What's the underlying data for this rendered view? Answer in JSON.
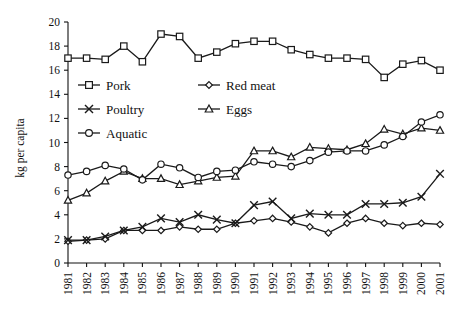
{
  "chart_data": {
    "type": "line",
    "title": "",
    "xlabel": "",
    "ylabel": "kg per capita",
    "xlim": [
      1981,
      2001
    ],
    "ylim": [
      0,
      20
    ],
    "ytick_step": 2,
    "grid": false,
    "legend_position": "inside-top-left",
    "x": [
      1981,
      1982,
      1983,
      1984,
      1985,
      1986,
      1987,
      1988,
      1989,
      1990,
      1991,
      1992,
      1993,
      1994,
      1995,
      1996,
      1997,
      1998,
      1999,
      2000,
      2001
    ],
    "categories": [
      "1981",
      "1982",
      "1983",
      "1984",
      "1985",
      "1986",
      "1987",
      "1988",
      "1989",
      "1990",
      "1991",
      "1992",
      "1993",
      "1994",
      "1995",
      "1996",
      "1997",
      "1998",
      "1999",
      "2000",
      "2001"
    ],
    "yticks": [
      "0",
      "2",
      "4",
      "6",
      "8",
      "10",
      "12",
      "14",
      "16",
      "18",
      "20"
    ],
    "series": [
      {
        "name": "Pork",
        "marker": "square",
        "values": [
          17.0,
          17.0,
          16.9,
          18.0,
          16.7,
          19.0,
          18.8,
          17.0,
          17.5,
          18.2,
          18.4,
          18.4,
          17.7,
          17.3,
          17.0,
          17.0,
          16.9,
          15.4,
          16.5,
          16.8,
          16.0
        ]
      },
      {
        "name": "Red meat",
        "marker": "diamond",
        "values": [
          1.8,
          1.9,
          2.0,
          2.7,
          2.7,
          2.7,
          3.0,
          2.8,
          2.8,
          3.3,
          3.5,
          3.7,
          3.4,
          3.0,
          2.5,
          3.3,
          3.7,
          3.3,
          3.1,
          3.3,
          3.2
        ]
      },
      {
        "name": "Poultry",
        "marker": "cross",
        "values": [
          1.9,
          1.9,
          2.2,
          2.7,
          3.0,
          3.7,
          3.4,
          4.0,
          3.6,
          3.3,
          4.8,
          5.1,
          3.7,
          4.1,
          4.0,
          4.0,
          4.9,
          4.9,
          5.0,
          5.5,
          7.4
        ]
      },
      {
        "name": "Eggs",
        "marker": "triangle",
        "values": [
          5.2,
          5.8,
          6.8,
          7.6,
          7.0,
          7.0,
          6.5,
          6.8,
          7.1,
          7.2,
          9.3,
          9.3,
          8.8,
          9.6,
          9.5,
          9.4,
          9.9,
          11.1,
          10.7,
          11.2,
          11.0
        ]
      },
      {
        "name": "Aquatic",
        "marker": "circle",
        "values": [
          7.3,
          7.6,
          8.1,
          7.8,
          6.9,
          8.2,
          7.9,
          7.1,
          7.6,
          7.7,
          8.4,
          8.2,
          8.0,
          8.5,
          9.2,
          9.3,
          9.3,
          9.8,
          10.5,
          11.7,
          12.3
        ]
      }
    ]
  },
  "legend": {
    "items": [
      {
        "label": "Pork",
        "marker": "square"
      },
      {
        "label": "Red meat",
        "marker": "diamond"
      },
      {
        "label": "Poultry",
        "marker": "cross"
      },
      {
        "label": "Eggs",
        "marker": "triangle"
      },
      {
        "label": "Aquatic",
        "marker": "circle"
      }
    ]
  },
  "colors": {
    "ink": "#1a1a1a",
    "background": "#ffffff"
  }
}
